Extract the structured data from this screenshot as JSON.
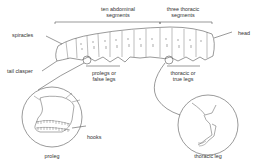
{
  "diagram": {
    "labels": {
      "abdominal": [
        "ten abdominal",
        "segments"
      ],
      "thoracic": [
        "three thoracic",
        "segments"
      ],
      "spiracles": "spiracles",
      "head": "head",
      "tail_clasper": "tail clasper",
      "prolegs": [
        "prolegs or",
        "false legs"
      ],
      "true_legs": [
        "thoracic or",
        "true legs"
      ],
      "hooks": "hooks",
      "proleg": "proleg",
      "thoracic_leg": "thoracic leg"
    },
    "colors": {
      "line": "#555555",
      "text": "#333333",
      "background": "#ffffff"
    }
  }
}
